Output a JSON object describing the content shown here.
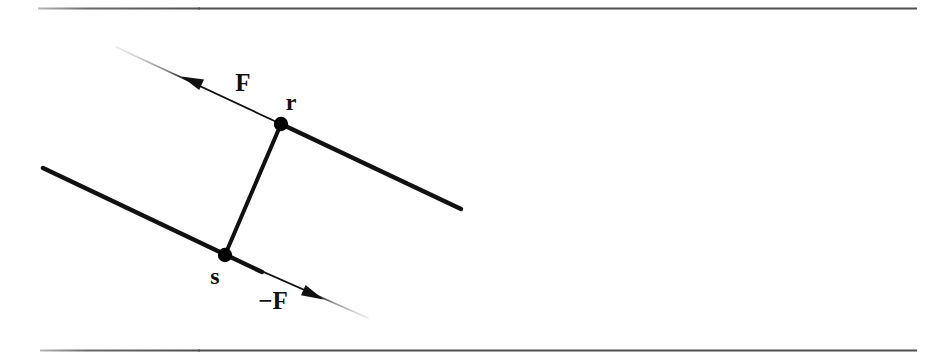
{
  "figure": {
    "background_color": "#ffffff",
    "width": 949,
    "height": 356,
    "rules": {
      "color": "#555555",
      "top": {
        "x1": 38,
        "y1": 8,
        "x2": 917,
        "y2": 8
      },
      "bottom": {
        "x1": 40,
        "y1": 350,
        "x2": 917,
        "y2": 350
      }
    },
    "labels": {
      "force": "F",
      "reaction_force": "−F",
      "point_r": "r",
      "point_s": "s"
    },
    "points": [
      {
        "name": "r",
        "label": "r",
        "x": 281,
        "y": 124,
        "radius": 7,
        "color": "#000000"
      },
      {
        "name": "s",
        "label": "s",
        "x": 225,
        "y": 255,
        "radius": 7,
        "color": "#000000"
      }
    ],
    "thick_lines": [
      {
        "name": "line-through-r",
        "x1": 281,
        "y1": 124,
        "x2": 460,
        "y2": 208,
        "width": 4.4,
        "color": "#111111"
      },
      {
        "name": "line-through-s",
        "x1": 43,
        "y1": 168,
        "x2": 262,
        "y2": 272,
        "width": 4.4,
        "color": "#111111"
      }
    ],
    "connector": {
      "name": "rs-connector",
      "x1": 281,
      "y1": 124,
      "x2": 225,
      "y2": 255,
      "width": 4.0,
      "color": "#111111"
    },
    "vectors": [
      {
        "name": "force-vector-F",
        "label": "F",
        "tail_x": 281,
        "tail_y": 124,
        "head_x": 182,
        "head_y": 77,
        "fade_x": 112,
        "fade_y": 45,
        "width": 1.7,
        "color": "#111111",
        "fade_color": "#dcdcdc",
        "direction": "up-left"
      },
      {
        "name": "force-vector-minus-F",
        "label": "−F",
        "tail_x": 225,
        "tail_y": 255,
        "head_x": 323,
        "head_y": 299,
        "fade_x": 372,
        "fade_y": 320,
        "width": 1.7,
        "color": "#111111",
        "fade_color": "#dcdcdc",
        "direction": "down-right"
      }
    ]
  }
}
